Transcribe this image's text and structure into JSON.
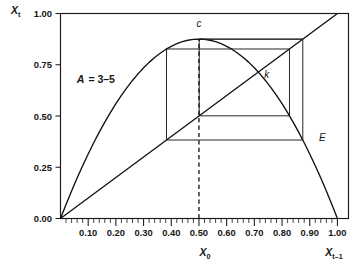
{
  "chart_data": {
    "type": "line",
    "title": "",
    "subtitle": "",
    "xlabel": "X_0",
    "xlabel_right": "X_t-1",
    "ylabel": "X_t",
    "xlim": [
      0.0,
      1.04
    ],
    "ylim": [
      0.0,
      1.0
    ],
    "grid": false,
    "legend": "none",
    "annotations": [
      {
        "id": "param",
        "text_main": "A",
        "text_rest": " = 3–5",
        "x": 0.16,
        "y": 0.66,
        "meaning": "logistic map parameter A = 3.5"
      },
      {
        "id": "c",
        "text": "c",
        "x": 0.5,
        "y": 0.875,
        "meaning": "critical point / curve maximum"
      },
      {
        "id": "k",
        "text": "k",
        "x": 0.7143,
        "y": 0.7143,
        "meaning": "unstable fixed point where curve meets 45-degree line"
      },
      {
        "id": "E",
        "text": "E",
        "x": 0.9115,
        "y": 0.3822,
        "meaning": "endpoint of period-4 cobweb"
      }
    ],
    "series": [
      {
        "name": "logistic-map-curve",
        "type": "line",
        "equation": "X_t = A * X_t-1 * (1 - X_t-1)",
        "A": 3.5,
        "x": [
          0.0,
          0.02,
          0.04,
          0.06,
          0.08,
          0.1,
          0.12,
          0.14,
          0.16,
          0.18,
          0.2,
          0.22,
          0.24,
          0.26,
          0.28,
          0.3,
          0.32,
          0.34,
          0.36,
          0.38,
          0.4,
          0.42,
          0.44,
          0.46,
          0.48,
          0.5,
          0.52,
          0.54,
          0.56,
          0.58,
          0.6,
          0.62,
          0.64,
          0.66,
          0.68,
          0.7,
          0.72,
          0.74,
          0.76,
          0.78,
          0.8,
          0.82,
          0.84,
          0.86,
          0.88,
          0.9,
          0.92,
          0.94,
          0.96,
          0.98,
          1.0
        ],
        "y": [
          0.0,
          0.0686,
          0.1344,
          0.1974,
          0.2576,
          0.315,
          0.3696,
          0.4214,
          0.4704,
          0.5166,
          0.56,
          0.6006,
          0.6384,
          0.6734,
          0.7056,
          0.735,
          0.7616,
          0.7854,
          0.8064,
          0.8246,
          0.84,
          0.8526,
          0.8624,
          0.8694,
          0.8736,
          0.875,
          0.8736,
          0.8694,
          0.8624,
          0.8526,
          0.84,
          0.8246,
          0.8064,
          0.7854,
          0.7616,
          0.735,
          0.7056,
          0.6734,
          0.6384,
          0.6006,
          0.56,
          0.5166,
          0.4704,
          0.4214,
          0.3696,
          0.315,
          0.2576,
          0.1974,
          0.1344,
          0.0686,
          0.0
        ]
      },
      {
        "name": "identity-diagonal",
        "type": "line",
        "equation": "X_t = X_t-1",
        "x": [
          0.0,
          1.0
        ],
        "y": [
          0.0,
          1.0
        ]
      },
      {
        "name": "cobweb-period-4",
        "type": "line",
        "orbit_x": [
          0.5,
          0.875,
          0.3828,
          0.8269,
          0.5009
        ],
        "orbit_y": [
          0.875,
          0.3828,
          0.8269,
          0.5009,
          0.875
        ],
        "path": [
          [
            0.5,
            0.875
          ],
          [
            0.875,
            0.875
          ],
          [
            0.875,
            0.3828
          ],
          [
            0.3828,
            0.3828
          ],
          [
            0.3828,
            0.8269
          ],
          [
            0.8269,
            0.8269
          ],
          [
            0.8269,
            0.5009
          ],
          [
            0.5009,
            0.5009
          ],
          [
            0.5009,
            0.875
          ],
          [
            0.875,
            0.875
          ]
        ]
      },
      {
        "name": "initial-condition-dashed",
        "type": "line",
        "x": [
          0.5,
          0.5
        ],
        "y": [
          0.0,
          0.875
        ]
      }
    ],
    "xticks": [
      0.1,
      0.2,
      0.3,
      0.4,
      0.5,
      0.6,
      0.7,
      0.8,
      0.9,
      1.0
    ],
    "xtick_labels": [
      "0.10",
      "0.20",
      "0.30",
      "0.40",
      "0.50",
      "0.60",
      "0.70",
      "0.80",
      "0.90",
      "1.00"
    ],
    "xtick_minor_step": 0.02,
    "yticks": [
      0.0,
      0.25,
      0.5,
      0.75,
      1.0
    ],
    "ytick_labels": [
      "0.00",
      "0.25",
      "0.50",
      "0.75",
      "1.00"
    ],
    "colors": {
      "line": "#111111",
      "frame": "#1a1a1a",
      "text": "#161616",
      "background": "#ffffff"
    }
  },
  "labels": {
    "y_axis_main": "X",
    "y_axis_sub": "t",
    "x_axis_center_main": "X",
    "x_axis_center_sub": "0",
    "x_axis_right_main": "X",
    "x_axis_right_sub": "t–1",
    "param_main": "A",
    "param_rest": "= 3–5",
    "point_c": "c",
    "point_k": "k",
    "point_E": "E"
  }
}
